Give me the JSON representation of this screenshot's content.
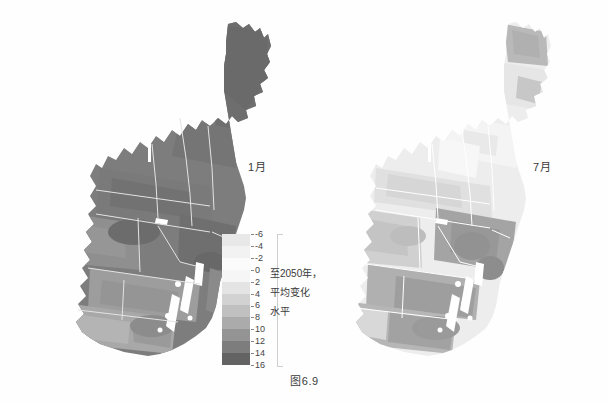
{
  "figure": {
    "caption": "图6.9",
    "background": "#fefefe"
  },
  "panels": [
    {
      "id": "jan",
      "month_label": "1月",
      "name": "january-map"
    },
    {
      "id": "jul",
      "month_label": "7月",
      "name": "july-map"
    }
  ],
  "legend": {
    "text_lines": [
      "至2050年，",
      "平均变化",
      "水平"
    ],
    "tick_labels": [
      "-6",
      "-4",
      "-2",
      "0",
      "2",
      "4",
      "6",
      "8",
      "10",
      "12",
      "14",
      "16"
    ],
    "band_colors": [
      "#e8e8e8",
      "#f2f2f2",
      "#fbfbfb",
      "#f6f6f6",
      "#e4e4e4",
      "#d2d2d2",
      "#c0c0c0",
      "#ababab",
      "#949494",
      "#7d7d7d",
      "#636363"
    ]
  },
  "chart_data": {
    "type": "heatmap",
    "title": "图6.9",
    "subtitle": "至2050年，平均变化水平",
    "panel_titles": [
      "1月",
      "7月"
    ],
    "region": "美国东北部",
    "colorbar": {
      "label": "至2050年，平均变化水平",
      "ticks": [
        -6,
        -4,
        -2,
        0,
        2,
        4,
        6,
        8,
        10,
        12,
        14,
        16
      ],
      "vmin": -6,
      "vmax": 16,
      "step": 2,
      "n_bands": 11,
      "orientation": "vertical",
      "colormap": "greys",
      "colors": [
        "#e8e8e8",
        "#f2f2f2",
        "#fbfbfb",
        "#f6f6f6",
        "#e4e4e4",
        "#d2d2d2",
        "#c0c0c0",
        "#ababab",
        "#949494",
        "#7d7d7d",
        "#636363"
      ]
    },
    "legend_position": "center-bottom",
    "grid": false,
    "panels": [
      {
        "name": "1月",
        "summary": "整体深灰，变化水平高（约10-16），北部缅因州与新英格兰最深",
        "regions": [
          {
            "name": "Maine",
            "value": 15
          },
          {
            "name": "New Hampshire",
            "value": 14
          },
          {
            "name": "Vermont",
            "value": 14
          },
          {
            "name": "New York",
            "value": 13
          },
          {
            "name": "Massachusetts",
            "value": 12
          },
          {
            "name": "Connecticut",
            "value": 12
          },
          {
            "name": "Rhode Island",
            "value": 12
          },
          {
            "name": "Pennsylvania",
            "value": 11
          },
          {
            "name": "New Jersey",
            "value": 10
          },
          {
            "name": "Maryland",
            "value": 8
          },
          {
            "name": "Delaware",
            "value": 9
          },
          {
            "name": "West Virginia",
            "value": 9
          },
          {
            "name": "Virginia",
            "value": 7
          }
        ]
      },
      {
        "name": "7月",
        "summary": "整体浅灰，变化水平低（约0-8），北部最浅，南部中灰",
        "regions": [
          {
            "name": "Maine",
            "value": 4
          },
          {
            "name": "New Hampshire",
            "value": 2
          },
          {
            "name": "Vermont",
            "value": 1
          },
          {
            "name": "New York",
            "value": 3
          },
          {
            "name": "Massachusetts",
            "value": 2
          },
          {
            "name": "Connecticut",
            "value": 3
          },
          {
            "name": "Rhode Island",
            "value": 3
          },
          {
            "name": "Pennsylvania",
            "value": 6
          },
          {
            "name": "New Jersey",
            "value": 8
          },
          {
            "name": "Maryland",
            "value": 9
          },
          {
            "name": "Delaware",
            "value": 9
          },
          {
            "name": "West Virginia",
            "value": 7
          },
          {
            "name": "Virginia",
            "value": 9
          }
        ]
      }
    ]
  }
}
